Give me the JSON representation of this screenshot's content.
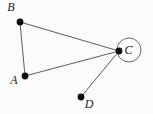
{
  "diagram": {
    "type": "graph",
    "canvas": {
      "width": 153,
      "height": 114,
      "background": "#fbfbfb"
    },
    "style": {
      "edge_color": "#4a4a4a",
      "edge_width": 0.9,
      "dot_color": "#0d0d0d",
      "dot_radius": 3.4,
      "label_color": "#1c1c1c",
      "label_font_size": 12,
      "highlight_circle_color": "#5a5a5a",
      "highlight_circle_width": 0.9
    },
    "nodes": [
      {
        "id": "B",
        "label": "B",
        "x": 20,
        "y": 22,
        "label_x": 11,
        "label_y": 7
      },
      {
        "id": "A",
        "label": "A",
        "x": 25,
        "y": 76,
        "label_x": 14,
        "label_y": 80
      },
      {
        "id": "C",
        "label": "C",
        "x": 119,
        "y": 51,
        "label_x": 128.5,
        "label_y": 50,
        "circled": true,
        "circle_cx": 129,
        "circle_cy": 50,
        "circle_r": 12
      },
      {
        "id": "D",
        "label": "D",
        "x": 81,
        "y": 97,
        "label_x": 89,
        "label_y": 104
      }
    ],
    "edges": [
      {
        "from": "B",
        "to": "C"
      },
      {
        "from": "B",
        "to": "A"
      },
      {
        "from": "A",
        "to": "C"
      },
      {
        "from": "D",
        "to": "C"
      }
    ]
  }
}
